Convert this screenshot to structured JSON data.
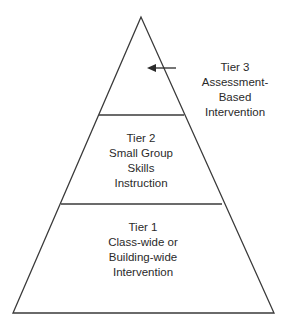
{
  "diagram": {
    "type": "pyramid",
    "colors": {
      "stroke": "#3a3a3a",
      "text": "#2a2a2a",
      "background": "#ffffff"
    },
    "tiers": [
      {
        "id": "tier3",
        "lines": [
          "Tier 3",
          "Assessment-",
          "Based",
          "Intervention"
        ]
      },
      {
        "id": "tier2",
        "lines": [
          "Tier 2",
          "Small Group",
          "Skills",
          "Instruction"
        ]
      },
      {
        "id": "tier1",
        "lines": [
          "Tier 1",
          "Class-wide or",
          "Building-wide",
          "Intervention"
        ]
      }
    ]
  }
}
